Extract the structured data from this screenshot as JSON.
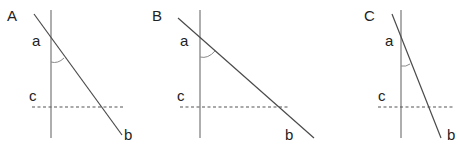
{
  "panels": [
    {
      "label": "A",
      "line_a_label": "a",
      "line_b_label": "b",
      "line_c_label": "c",
      "vertical": {
        "x": 51,
        "y1": 10,
        "y2": 138
      },
      "diagonal": {
        "x1": 34,
        "y1": 14,
        "x2": 122,
        "y2": 135
      },
      "dashed": {
        "y": 107,
        "x1": 32,
        "x2": 124
      },
      "label_pos": {
        "panel": [
          7,
          21
        ],
        "a": [
          32,
          46
        ],
        "c": [
          29,
          101
        ],
        "b": [
          124,
          140
        ]
      },
      "arc": "M51,62 Q58,64 64,58"
    },
    {
      "label": "B",
      "line_a_label": "a",
      "line_b_label": "b",
      "line_c_label": "c",
      "vertical": {
        "x": 200,
        "y1": 10,
        "y2": 138
      },
      "diagonal": {
        "x1": 178,
        "y1": 18,
        "x2": 314,
        "y2": 138
      },
      "dashed": {
        "y": 107,
        "x1": 180,
        "x2": 290
      },
      "label_pos": {
        "panel": [
          152,
          21
        ],
        "a": [
          180,
          46
        ],
        "c": [
          177,
          101
        ],
        "b": [
          285,
          140
        ]
      },
      "arc": "M200,57 Q208,59 215,51"
    },
    {
      "label": "C",
      "line_a_label": "a",
      "line_b_label": "b",
      "line_c_label": "c",
      "vertical": {
        "x": 401,
        "y1": 10,
        "y2": 138
      },
      "diagonal": {
        "x1": 392,
        "y1": 14,
        "x2": 441,
        "y2": 138
      },
      "dashed": {
        "y": 107,
        "x1": 378,
        "x2": 455
      },
      "label_pos": {
        "panel": [
          364,
          21
        ],
        "a": [
          385,
          46
        ],
        "c": [
          378,
          101
        ],
        "b": [
          447,
          140
        ]
      },
      "arc": "M401,66 Q406,67 410,64"
    }
  ],
  "colors": {
    "vertical": "#9a9a9a",
    "diagonal": "#4a4a4a",
    "dashed": "#555555",
    "arc": "#8a8a8a"
  }
}
